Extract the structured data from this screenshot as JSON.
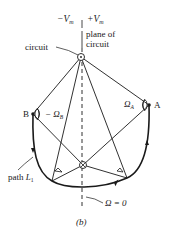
{
  "diagram": {
    "caption": "(b)",
    "labels": {
      "neg_vm": "−V",
      "neg_vm_sub": "m",
      "pos_vm": "+V",
      "pos_vm_sub": "m",
      "plane_line1": "plane of",
      "plane_line2": "circuit",
      "circuit": "circuit",
      "point_a": "A",
      "point_b": "B",
      "omega_a": "Ω",
      "omega_a_sub": "A",
      "omega_b": "− Ω",
      "omega_b_sub": "B",
      "path": "path ",
      "path_var": "L",
      "path_sub": "1",
      "omega_zero": "Ω = 0"
    },
    "colors": {
      "ink": "#1a1a1a",
      "background": "#ffffff"
    }
  }
}
